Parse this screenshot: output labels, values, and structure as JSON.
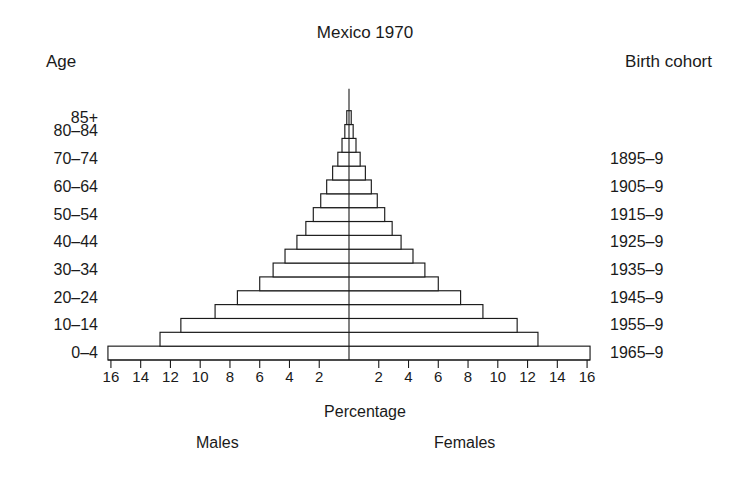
{
  "chart_data": {
    "type": "bar",
    "title": "Mexico 1970",
    "subtype": "population-pyramid",
    "xlabel": "Percentage",
    "ylabel": "Age",
    "right_axis_label": "Birth cohort",
    "left_group_label": "Males",
    "right_group_label": "Females",
    "grid": false,
    "legend": "none",
    "xlim": [
      -17.5,
      17.5
    ],
    "xticks": [
      16,
      14,
      12,
      10,
      8,
      6,
      4,
      2,
      2,
      4,
      6,
      8,
      10,
      12,
      14,
      16
    ],
    "xtick_labels": [
      "16",
      "14",
      "12",
      "10",
      "8",
      "6",
      "4",
      "2",
      "2",
      "4",
      "6",
      "8",
      "10",
      "12",
      "14",
      "16"
    ],
    "categories": [
      "0-4",
      "5-9",
      "10-14",
      "15-19",
      "20-24",
      "25-29",
      "30-34",
      "35-39",
      "40-44",
      "45-49",
      "50-54",
      "55-59",
      "60-64",
      "65-69",
      "70-74",
      "75-79",
      "80-84",
      "85+"
    ],
    "age_tick_labels": [
      "0–4",
      "10–14",
      "20–24",
      "30–34",
      "40–44",
      "50–54",
      "60–64",
      "70–74",
      "80–84",
      "85+"
    ],
    "birth_cohort_labels": [
      "1965–9",
      "1955–9",
      "1945–9",
      "1935–9",
      "1925–9",
      "1915–9",
      "1905–9",
      "1895–9"
    ],
    "series": [
      {
        "name": "Males",
        "side": "left",
        "values": [
          16.2,
          12.7,
          11.3,
          9.0,
          7.5,
          6.0,
          5.1,
          4.3,
          3.5,
          2.9,
          2.4,
          1.9,
          1.5,
          1.1,
          0.75,
          0.47,
          0.28,
          0.15
        ]
      },
      {
        "name": "Females",
        "side": "right",
        "values": [
          16.2,
          12.7,
          11.3,
          9.0,
          7.5,
          6.0,
          5.1,
          4.3,
          3.5,
          2.9,
          2.4,
          1.9,
          1.5,
          1.1,
          0.75,
          0.47,
          0.28,
          0.15
        ]
      }
    ]
  },
  "title": "Mexico 1970",
  "axis": {
    "left_header": "Age",
    "right_header": "Birth cohort",
    "x_title": "Percentage",
    "males": "Males",
    "females": "Females"
  }
}
